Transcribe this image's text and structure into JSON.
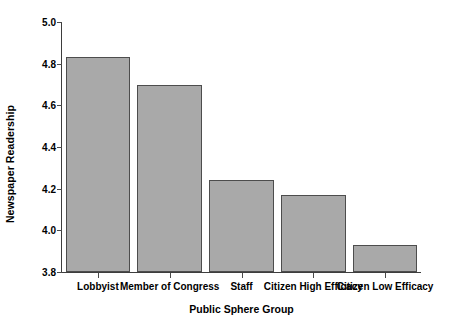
{
  "chart_data": {
    "type": "bar",
    "title": "",
    "categories": [
      "Lobbyist",
      "Member of Congress",
      "Staff",
      "Citizen High Efficacy",
      "Citizen Low Efficacy"
    ],
    "values": [
      4.83,
      4.7,
      4.24,
      4.17,
      3.93
    ],
    "xlabel": "Public Sphere Group",
    "ylabel": "Newspaper Readership",
    "ylim": [
      3.8,
      5.0
    ],
    "yticks": [
      3.8,
      4.0,
      4.2,
      4.4,
      4.6,
      4.8,
      5.0
    ],
    "ytick_labels": [
      "3.8",
      "4.0",
      "4.2",
      "4.4",
      "4.6",
      "4.8",
      "5.0"
    ],
    "grid": false,
    "legend": null,
    "bar_fill_color": "#a9a9a9",
    "bar_edge_color": "#4d4d4d",
    "axis_color": "#3d3d3d",
    "background_color": "#ffffff"
  }
}
